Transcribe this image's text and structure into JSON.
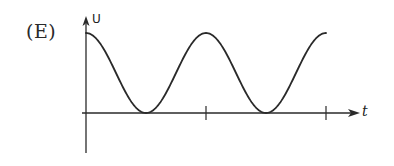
{
  "figure": {
    "option_label": "(E)",
    "y_axis_label": "U",
    "x_axis_label": "t"
  },
  "colors": {
    "ink": "#2a2a2a",
    "background": "#ffffff"
  },
  "chart_data": {
    "type": "line",
    "title": "",
    "option": "(E)",
    "xlabel": "t",
    "ylabel": "U",
    "x": [
      0,
      0.25,
      0.5,
      0.75,
      1.0,
      1.25,
      1.5,
      1.75,
      2.0
    ],
    "values": [
      1,
      0.5,
      0,
      0.5,
      1,
      0.5,
      0,
      0.5,
      1
    ],
    "x_ticks": [
      1,
      2
    ],
    "x_tick_labels": [
      "",
      ""
    ],
    "ylim": [
      0,
      1
    ],
    "grid": false,
    "legend": null
  }
}
